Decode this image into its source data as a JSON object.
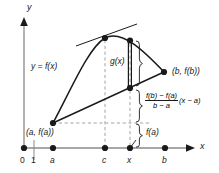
{
  "figure": {
    "name": "mean-value-theorem-diagram",
    "axes": {
      "y_axis_label": "y",
      "x_axis_label": "x"
    },
    "x_ticks": [
      {
        "id": "origin",
        "label": "0",
        "italic": false,
        "dot": true,
        "x": 24
      },
      {
        "id": "one",
        "label": "1",
        "italic": false,
        "dot": false,
        "x": 34
      },
      {
        "id": "a",
        "label": "a",
        "italic": true,
        "dot": true,
        "x": 53
      },
      {
        "id": "c",
        "label": "c",
        "italic": true,
        "dot": true,
        "x": 105
      },
      {
        "id": "x",
        "label": "x",
        "italic": true,
        "dot": true,
        "x": 130
      },
      {
        "id": "b",
        "label": "b",
        "italic": true,
        "dot": true,
        "x": 165
      }
    ],
    "annotations": {
      "curve_label": "y = f(x)",
      "point_a_label": "(a, f(a))",
      "point_b_label": "(b, f(b))",
      "g_label": "g(x)",
      "fa_label": "f(a)"
    },
    "formula": {
      "numerator": "f(b) − f(a)",
      "denominator": "b − a",
      "tail": "(x − a)"
    },
    "colors": {
      "ink": "#1a1a1a",
      "axis": "#8a8a8a",
      "dashed": "#9a9a9a",
      "background": "#ffffff"
    }
  }
}
